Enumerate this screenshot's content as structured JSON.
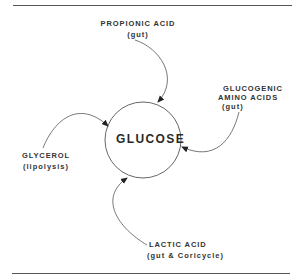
{
  "diagram": {
    "center": {
      "label": "GLUCOSE"
    },
    "sources": [
      {
        "name": "PROPIONIC ACID",
        "detail": "(gut)"
      },
      {
        "name": "GLUCOGENIC AMINO ACIDS",
        "name_line1": "GLUCOGENIC",
        "name_line2": "AMINO ACIDS",
        "detail": "(gut)"
      },
      {
        "name": "GLYCEROL",
        "detail": "(lipolysis)"
      },
      {
        "name": "LACTIC ACID",
        "detail": "(gut & Coricycle)"
      }
    ]
  }
}
